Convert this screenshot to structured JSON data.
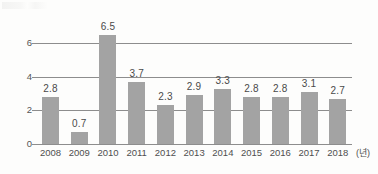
{
  "chart_data": {
    "type": "bar",
    "title": "",
    "subtitle": "",
    "xlabel": "(년)",
    "ylabel": "",
    "categories": [
      "2008",
      "2009",
      "2010",
      "2011",
      "2012",
      "2013",
      "2014",
      "2015",
      "2016",
      "2017",
      "2018"
    ],
    "values": [
      2.8,
      0.7,
      6.5,
      3.7,
      2.3,
      2.9,
      3.3,
      2.8,
      2.8,
      3.1,
      2.7
    ],
    "data_labels": [
      "2.8",
      "0.7",
      "6.5",
      "3.7",
      "2.3",
      "2.9",
      "3.3",
      "2.8",
      "2.8",
      "3.1",
      "2.7"
    ],
    "ylim": [
      0,
      6.8
    ],
    "yticks": [
      0,
      2,
      4,
      6
    ],
    "ytick_labels": [
      "0",
      "2",
      "4",
      "6"
    ],
    "grid": true,
    "grid_axis": "y",
    "legend": "none",
    "bar_color": "#a3a3a3",
    "grid_color": "#8d8d8d",
    "text_color": "#4f4f4f",
    "background_color": "#fdfdfc"
  },
  "axes": {
    "y_ticks": [
      {
        "label": "6",
        "value": 6
      },
      {
        "label": "4",
        "value": 4
      },
      {
        "label": "2",
        "value": 2
      },
      {
        "label": "0",
        "value": 0
      }
    ],
    "x_unit": "(년)"
  },
  "series": [
    {
      "category": "2008",
      "label": "2.8",
      "value": 2.8
    },
    {
      "category": "2009",
      "label": "0.7",
      "value": 0.7
    },
    {
      "category": "2010",
      "label": "6.5",
      "value": 6.5
    },
    {
      "category": "2011",
      "label": "3.7",
      "value": 3.7
    },
    {
      "category": "2012",
      "label": "2.3",
      "value": 2.3
    },
    {
      "category": "2013",
      "label": "2.9",
      "value": 2.9
    },
    {
      "category": "2014",
      "label": "3.3",
      "value": 3.3
    },
    {
      "category": "2015",
      "label": "2.8",
      "value": 2.8
    },
    {
      "category": "2016",
      "label": "2.8",
      "value": 2.8
    },
    {
      "category": "2017",
      "label": "3.1",
      "value": 3.1
    },
    {
      "category": "2018",
      "label": "2.7",
      "value": 2.7
    }
  ]
}
